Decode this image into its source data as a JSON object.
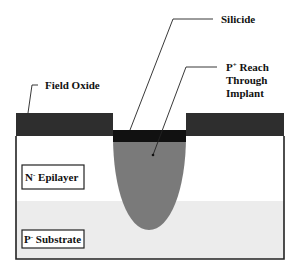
{
  "diagram": {
    "labels": {
      "silicide": "Silicide",
      "p_reach_line1_base": "P",
      "p_reach_line1_sup": "+",
      "p_reach_line1_rest": " Reach",
      "p_reach_line2": "Through",
      "p_reach_line3": "Implant",
      "field_oxide": "Field Oxide",
      "epilayer_base": "N",
      "epilayer_sup": "-",
      "epilayer_rest": " Epilayer",
      "substrate_base": "P",
      "substrate_sup": "-",
      "substrate_rest": " Substrate"
    },
    "colors": {
      "oxide": "#2e2e2e",
      "silicide": "#111111",
      "implant": "#7a7a7a",
      "epilayer": "#ffffff",
      "substrate": "#ececec",
      "outline": "#222222"
    }
  }
}
